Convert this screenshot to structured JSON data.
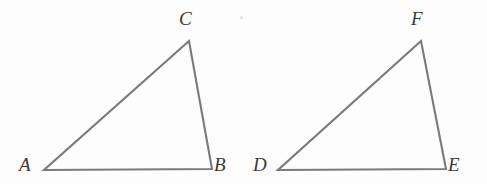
{
  "figure": {
    "background_color": "#fdfdfd",
    "stroke_color": "#7a7a7a",
    "stroke_width": 2.1,
    "label_color": "#3a3a3a",
    "width": 487,
    "height": 184,
    "shapes": [
      {
        "name": "triangle-abc",
        "type": "triangle",
        "vertices": [
          {
            "label": "A",
            "x": 44,
            "y": 170
          },
          {
            "label": "B",
            "x": 212,
            "y": 169
          },
          {
            "label": "C",
            "x": 189,
            "y": 41
          }
        ],
        "points": "44,170 212,169 189,41"
      },
      {
        "name": "triangle-def",
        "type": "triangle",
        "vertices": [
          {
            "label": "D",
            "x": 278,
            "y": 170
          },
          {
            "label": "E",
            "x": 446,
            "y": 169
          },
          {
            "label": "F",
            "x": 421,
            "y": 41
          }
        ],
        "points": "278,170 446,169 421,41"
      }
    ],
    "labels": {
      "a": "A",
      "b": "B",
      "c": "C",
      "d": "D",
      "e": "E",
      "f": "F"
    }
  }
}
